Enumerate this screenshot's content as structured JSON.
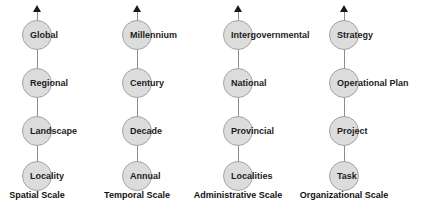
{
  "diagram": {
    "background_color": "#ffffff",
    "node_fill_color": "#dcdcdc",
    "node_stroke_color": "#a3a3a3",
    "line_color": "#8c8c8c",
    "text_color": "#1c1c1c",
    "columns": [
      {
        "axis_label": "Spatial Scale",
        "center_x": 37,
        "nodes": [
          {
            "label": "Global",
            "center_y": 35
          },
          {
            "label": "Regional",
            "center_y": 83
          },
          {
            "label": "Landscape",
            "center_y": 131
          },
          {
            "label": "Locality",
            "center_y": 176
          }
        ]
      },
      {
        "axis_label": "Temporal Scale",
        "center_x": 137,
        "nodes": [
          {
            "label": "Millennium",
            "center_y": 35
          },
          {
            "label": "Century",
            "center_y": 83
          },
          {
            "label": "Decade",
            "center_y": 131
          },
          {
            "label": "Annual",
            "center_y": 176
          }
        ]
      },
      {
        "axis_label": "Administrative Scale",
        "center_x": 238,
        "nodes": [
          {
            "label": "Intergovernmental",
            "center_y": 35
          },
          {
            "label": "National",
            "center_y": 83
          },
          {
            "label": "Provincial",
            "center_y": 131
          },
          {
            "label": "Localities",
            "center_y": 176
          }
        ]
      },
      {
        "axis_label": "Organizational Scale",
        "center_x": 344,
        "nodes": [
          {
            "label": "Strategy",
            "center_y": 35
          },
          {
            "label": "Operational Plan",
            "center_y": 83
          },
          {
            "label": "Project",
            "center_y": 131
          },
          {
            "label": "Task",
            "center_y": 176
          }
        ]
      }
    ]
  }
}
